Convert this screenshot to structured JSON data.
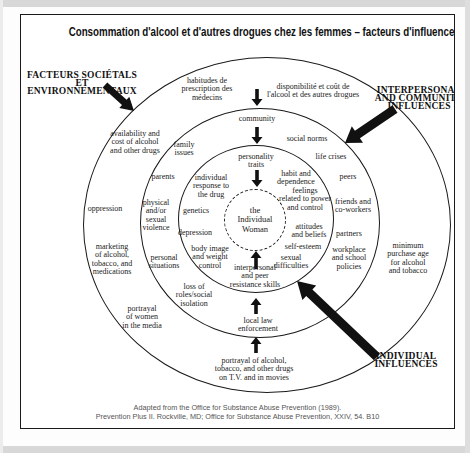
{
  "title": "Consommation d'alcool et d'autres drogues chez les femmes – facteurs d'influence",
  "corner_labels": {
    "societal": "FACTEURS SOCIÉTALS\nET ENVIRONNEMENTAUX",
    "interpersonal": "INTERPERSONAL\nAND COMMUNITY\nINFLUENCES",
    "individual": "INDIVIDUAL\nINFLUENCES"
  },
  "diagram": {
    "center_label": "the\nIndividual\nWoman",
    "rings": [
      {
        "name": "societal-environmental-factors",
        "nodes": [
          {
            "id": "habitudes-prescription",
            "text": "habitudes de\nprescription des\nmédecins",
            "x": 186,
            "y": 75
          },
          {
            "id": "disponibilite-cout",
            "text": "disponibilité et coût de\nl'alcool et des autres drogues",
            "x": 292,
            "y": 76
          },
          {
            "id": "availability-cost",
            "text": "availability and\ncost of alcohol\nand other drugs",
            "x": 114,
            "y": 128
          },
          {
            "id": "oppression",
            "text": "oppression",
            "x": 84,
            "y": 194
          },
          {
            "id": "marketing",
            "text": "marketing\nof alcohol,\ntobacco, and\nmedications",
            "x": 91,
            "y": 245
          },
          {
            "id": "portrayal-women-media",
            "text": "portrayal\nof women\nin the media",
            "x": 121,
            "y": 303
          },
          {
            "id": "portrayal-alcohol-tv",
            "text": "portrayal of alcohol,\ntobacco, and other drugs\non T.V. and in movies",
            "x": 233,
            "y": 355
          },
          {
            "id": "minimum-purchase-age",
            "text": "minimum\npurchase age\nfor alcohol\nand tobacco",
            "x": 387,
            "y": 244
          }
        ]
      },
      {
        "name": "interpersonal-community-influences",
        "nodes": [
          {
            "id": "community",
            "text": "community",
            "x": 236,
            "y": 104
          },
          {
            "id": "social-norms",
            "text": "social norms",
            "x": 286,
            "y": 124
          },
          {
            "id": "family-issues",
            "text": "family\nissues",
            "x": 163,
            "y": 134
          },
          {
            "id": "life-crises",
            "text": "life crises",
            "x": 310,
            "y": 142
          },
          {
            "id": "parents",
            "text": "parents",
            "x": 142,
            "y": 162
          },
          {
            "id": "peers",
            "text": "peers",
            "x": 327,
            "y": 162
          },
          {
            "id": "physical-sexual-violence",
            "text": "physical\nand/or\nsexual\nviolence",
            "x": 135,
            "y": 201
          },
          {
            "id": "friends-coworkers",
            "text": "friends and\nco-workers",
            "x": 332,
            "y": 191
          },
          {
            "id": "partners",
            "text": "partners",
            "x": 328,
            "y": 219
          },
          {
            "id": "personal-situations",
            "text": "personal\nsituations",
            "x": 143,
            "y": 247
          },
          {
            "id": "workplace-school-policies",
            "text": "workplace\nand school\npolicies",
            "x": 328,
            "y": 244
          },
          {
            "id": "loss-roles-isolation",
            "text": "loss of\nroles/social\nisolation",
            "x": 173,
            "y": 281
          },
          {
            "id": "local-law-enforcement",
            "text": "local law\nenforcement",
            "x": 237,
            "y": 310
          }
        ]
      },
      {
        "name": "individual-influences",
        "nodes": [
          {
            "id": "personality-traits",
            "text": "personality\ntraits",
            "x": 235,
            "y": 146
          },
          {
            "id": "individual-response-drug",
            "text": "individual\nresponse to\nthe drug",
            "x": 190,
            "y": 172
          },
          {
            "id": "habit-dependence",
            "text": "habit and\ndependence",
            "x": 275,
            "y": 163
          },
          {
            "id": "genetics",
            "text": "genetics",
            "x": 175,
            "y": 196
          },
          {
            "id": "feelings-power-control",
            "text": "feelings\nrelated to power\nand control",
            "x": 284,
            "y": 185
          },
          {
            "id": "depression",
            "text": "depression",
            "x": 174,
            "y": 218
          },
          {
            "id": "attitudes-beliefs",
            "text": "attitudes\nand beliefs",
            "x": 288,
            "y": 216
          },
          {
            "id": "body-image-weight",
            "text": "body image\nand weight\ncontrol",
            "x": 189,
            "y": 243
          },
          {
            "id": "self-esteem",
            "text": "self-esteem",
            "x": 282,
            "y": 232
          },
          {
            "id": "sexual-difficulties",
            "text": "sexual\ndifficulties",
            "x": 270,
            "y": 247
          },
          {
            "id": "interpersonal-peer-skills",
            "text": "interpersonal\nand peer\nresistance skills",
            "x": 234,
            "y": 262
          }
        ]
      }
    ]
  },
  "caption": "Adapted from the Office for Substance Abuse Prevention (1989).\nPrevention Plus II. Rockville, MD; Office for Substance Abuse Prevention, XXIV, 54. B10"
}
